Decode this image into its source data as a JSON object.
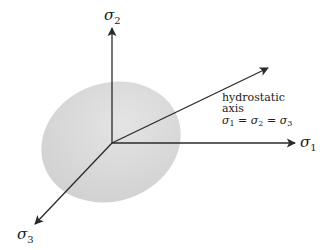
{
  "diagram": {
    "axes": {
      "sigma1": {
        "symbol": "σ",
        "subscript": "1"
      },
      "sigma2": {
        "symbol": "σ",
        "subscript": "2"
      },
      "sigma3": {
        "symbol": "σ",
        "subscript": "3"
      }
    },
    "hydrostatic": {
      "line1": "hydrostatic",
      "line2": "axis",
      "equation": {
        "s1": "σ",
        "sub1": "1",
        "eq1": " = ",
        "s2": "σ",
        "sub2": "2",
        "eq2": " = ",
        "s3": "σ",
        "sub3": "3"
      }
    },
    "colors": {
      "ellipse_fill": "#d9d9d9",
      "axis_stroke": "#2a2a2a",
      "background": "#ffffff"
    }
  }
}
